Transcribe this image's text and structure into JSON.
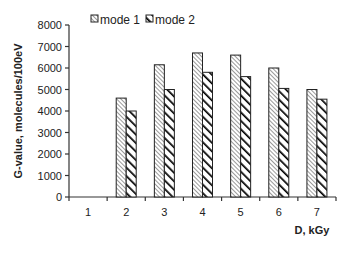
{
  "chart_data": {
    "type": "bar",
    "title": "",
    "xlabel": "D, kGy",
    "ylabel": "G-value, molecules/100eV",
    "categories": [
      "1",
      "2",
      "3",
      "4",
      "5",
      "6",
      "7"
    ],
    "series": [
      {
        "name": "mode 1",
        "pattern": "fine-hatch",
        "values": [
          0,
          4600,
          6150,
          6700,
          6600,
          6000,
          5000
        ]
      },
      {
        "name": "mode 2",
        "pattern": "bold-stripe",
        "values": [
          0,
          4000,
          5000,
          5800,
          5600,
          5050,
          4550
        ]
      }
    ],
    "ylim": [
      0,
      8000
    ],
    "yticks": [
      "0",
      "1000",
      "2000",
      "3000",
      "4000",
      "5000",
      "6000",
      "7000",
      "8000"
    ],
    "grid": false,
    "legend_position": "top"
  },
  "legend": {
    "items": [
      {
        "label": "mode 1"
      },
      {
        "label": "mode 2"
      }
    ]
  },
  "colors": {
    "axis": "#333333",
    "bar_outline": "#222222",
    "hatch_fine": "#555555",
    "stripe_bold": "#000000"
  }
}
